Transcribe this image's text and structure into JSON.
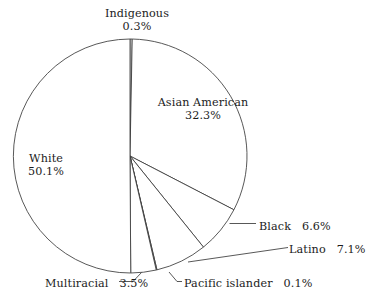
{
  "chart_data": {
    "type": "pie",
    "title": "",
    "subtitle": "",
    "xlabel": "",
    "ylabel": "",
    "legend_position": "none",
    "grid": false,
    "start_angle_deg": 0,
    "direction": "clockwise",
    "units": "percent",
    "categories": [
      "Indigenous",
      "Asian American",
      "Black",
      "Latino",
      "Pacific islander",
      "Multiracial",
      "White"
    ],
    "values": [
      0.3,
      32.3,
      6.6,
      7.1,
      0.1,
      3.5,
      50.1
    ],
    "slices": [
      {
        "label": "Indigenous",
        "value": 0.3,
        "value_text": "0.3%",
        "label_style": "two-line",
        "leader": false,
        "color": "#ffffff",
        "stroke": "#3a3a3a"
      },
      {
        "label": "Asian American",
        "value": 32.3,
        "value_text": "32.3%",
        "label_style": "two-line",
        "leader": false,
        "color": "#ffffff",
        "stroke": "#3a3a3a"
      },
      {
        "label": "Black",
        "value": 6.6,
        "value_text": "6.6%",
        "label_style": "inline",
        "leader": true,
        "color": "#ffffff",
        "stroke": "#3a3a3a"
      },
      {
        "label": "Latino",
        "value": 7.1,
        "value_text": "7.1%",
        "label_style": "inline",
        "leader": true,
        "color": "#ffffff",
        "stroke": "#3a3a3a"
      },
      {
        "label": "Pacific islander",
        "value": 0.1,
        "value_text": "0.1%",
        "label_style": "inline",
        "leader": true,
        "color": "#ffffff",
        "stroke": "#3a3a3a"
      },
      {
        "label": "Multiracial",
        "value": 3.5,
        "value_text": "3.5%",
        "label_style": "inline",
        "leader": true,
        "color": "#ffffff",
        "stroke": "#3a3a3a"
      },
      {
        "label": "White",
        "value": 50.1,
        "value_text": "50.1%",
        "label_style": "two-line",
        "leader": false,
        "color": "#ffffff",
        "stroke": "#3a3a3a"
      }
    ]
  },
  "figure": {
    "background_color": "#ffffff",
    "line_color": "#3a3a3a",
    "text_color": "#1c1c1c",
    "center_x": 130,
    "center_y": 156,
    "radius": 117
  }
}
